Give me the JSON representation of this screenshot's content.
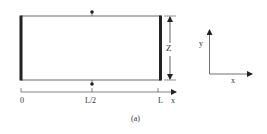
{
  "figure": {
    "caption": "(a)",
    "dimension_label": "Z",
    "axis": {
      "ticks": [
        "0",
        "L/2",
        "L"
      ],
      "axis_label": "x"
    },
    "coordinate_frame": {
      "x_label": "x",
      "y_label": "y"
    }
  }
}
